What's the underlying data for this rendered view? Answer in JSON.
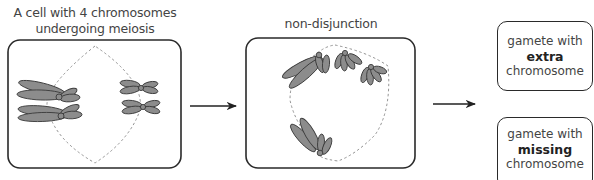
{
  "panels": [
    {
      "id": "meiosis-cell",
      "title_lines": [
        "A cell with 4 chromosomes",
        "undergoing meiosis"
      ]
    },
    {
      "id": "non-disjunction-cell",
      "title_lines": [
        "non-disjunction"
      ]
    }
  ],
  "outcomes": [
    {
      "line1": "gamete with",
      "emphasis": "extra",
      "line3": "chromosome"
    },
    {
      "line1": "gamete with",
      "emphasis": "missing",
      "line3": "chromosome"
    }
  ],
  "colors": {
    "chromosome_fill": "#8c8c8c",
    "chromosome_stroke": "#3a3a3a",
    "box_stroke": "#2a2a2a",
    "spindle": "#888888",
    "text": "#444444"
  }
}
